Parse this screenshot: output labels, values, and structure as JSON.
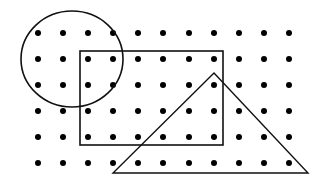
{
  "diagram": {
    "title": "",
    "background": "#ffffff",
    "stroke_color": "#111111",
    "dot_color": "#000000",
    "dot_grid": {
      "columns_x": [
        38,
        63,
        88,
        113,
        138,
        163,
        189,
        214,
        239,
        264,
        289
      ],
      "rows_y": [
        33,
        59,
        85,
        111,
        137,
        163
      ],
      "dot_radius": 3
    },
    "shapes": [
      {
        "type": "circle",
        "name": "circle",
        "cx": 72,
        "cy": 59,
        "rx": 51,
        "ry": 48
      },
      {
        "type": "rectangle",
        "name": "rectangle",
        "x": 80,
        "y": 51,
        "width": 143,
        "height": 94
      },
      {
        "type": "triangle",
        "name": "triangle",
        "points": [
          [
            214,
            73
          ],
          [
            308,
            173
          ],
          [
            113,
            173
          ]
        ]
      }
    ]
  }
}
